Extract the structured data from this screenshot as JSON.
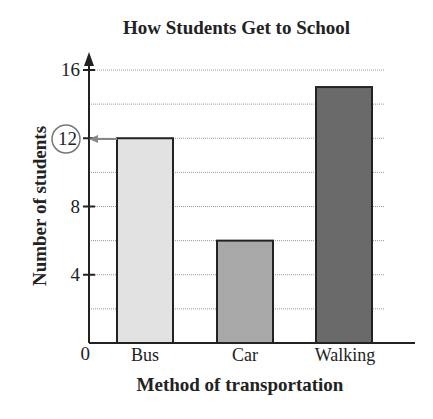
{
  "chart_data": {
    "type": "bar",
    "title": "How Students Get to School",
    "xlabel": "Method of transportation",
    "ylabel": "Number of students",
    "categories": [
      "Bus",
      "Car",
      "Walking"
    ],
    "values": [
      12,
      6,
      15
    ],
    "colors": [
      "#e2e2e2",
      "#a8a8a8",
      "#6a6a6a"
    ],
    "ylim": [
      0,
      16
    ],
    "yticks": [
      0,
      4,
      8,
      12,
      16
    ],
    "grid": true,
    "grid_step": 2,
    "annotation": {
      "value": "12",
      "style": "circled label with arrow pointing to Bus bar top"
    }
  },
  "labels": {
    "tick_0": "0",
    "tick_4": "4",
    "tick_8": "8",
    "tick_12": "12",
    "tick_16": "16",
    "cat_0": "Bus",
    "cat_1": "Car",
    "cat_2": "Walking"
  }
}
